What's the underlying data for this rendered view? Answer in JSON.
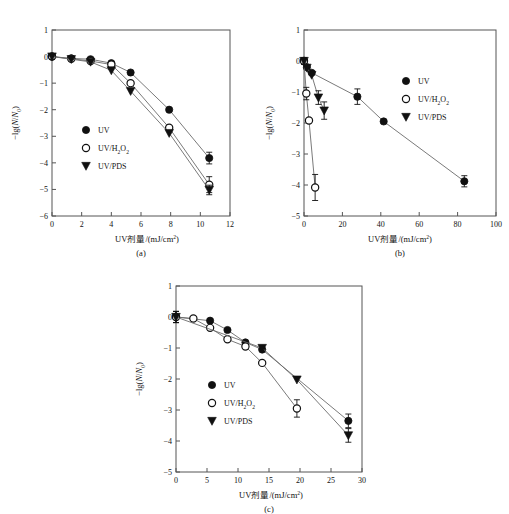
{
  "figure": {
    "background": "#ffffff",
    "axis_color": "#555555",
    "marker_fill_solid": "#101010",
    "marker_fill_open": "#ffffff",
    "line_color": "#6b6b6b"
  },
  "panels": [
    {
      "id": "a",
      "caption": "(a)",
      "xlabel": "UV剂量/(mJ/cm²)",
      "ylabel": "−lg(N/N₀)",
      "xlim": [
        0,
        12
      ],
      "ylim": [
        -6,
        1
      ],
      "xticks": [
        0,
        2,
        4,
        6,
        8,
        10,
        12
      ],
      "yticks": [
        1,
        0,
        -1,
        -2,
        -3,
        -4,
        -5,
        -6
      ],
      "legend": [
        "UV",
        "UV/H₂O₂",
        "UV/PDS"
      ]
    },
    {
      "id": "b",
      "caption": "(b)",
      "xlabel": "UV剂量/(mJ/cm²)",
      "ylabel": "−lg(N/N₀)",
      "xlim": [
        0,
        100
      ],
      "ylim": [
        -5,
        1
      ],
      "xticks": [
        0,
        20,
        40,
        60,
        80,
        100
      ],
      "yticks": [
        1,
        0,
        -1,
        -2,
        -3,
        -4,
        -5
      ],
      "legend": [
        "UV",
        "UV/H₂O₂",
        "UV/PDS"
      ]
    },
    {
      "id": "c",
      "caption": "(c)",
      "xlabel": "UV剂量/(mJ/cm²)",
      "ylabel": "−lg(N/N₀)",
      "xlim": [
        0,
        30
      ],
      "ylim": [
        -5,
        1
      ],
      "xticks": [
        0,
        5,
        10,
        15,
        20,
        25,
        30
      ],
      "yticks": [
        1,
        0,
        -1,
        -2,
        -3,
        -4,
        -5
      ],
      "legend": [
        "UV",
        "UV/H₂O₂",
        "UV/PDS"
      ]
    }
  ],
  "chart_data": [
    {
      "type": "scatter",
      "panel": "a",
      "title": "(a)",
      "xlabel": "UV剂量/(mJ/cm²)",
      "ylabel": "−lg(N/N₀)",
      "xlim": [
        0,
        12
      ],
      "ylim": [
        -6,
        1
      ],
      "xticks": [
        0,
        2,
        4,
        6,
        8,
        10,
        12
      ],
      "yticks": [
        1,
        0,
        -1,
        -2,
        -3,
        -4,
        -5,
        -6
      ],
      "grid": false,
      "legend_position": "lower-left-inside",
      "series": [
        {
          "name": "UV",
          "marker": "filled-circle",
          "x": [
            0,
            1.3,
            2.6,
            4.0,
            5.3,
            7.9,
            10.6
          ],
          "y": [
            0.0,
            -0.07,
            -0.1,
            -0.25,
            -0.6,
            -2.0,
            -3.82
          ],
          "yerr": [
            0.1,
            0.0,
            0.0,
            0.0,
            0.0,
            0.0,
            0.22
          ]
        },
        {
          "name": "UV/H₂O₂",
          "marker": "open-circle",
          "x": [
            0,
            1.3,
            2.6,
            4.0,
            5.3,
            7.9,
            10.6
          ],
          "y": [
            0.0,
            -0.08,
            -0.17,
            -0.3,
            -1.0,
            -2.68,
            -4.82
          ],
          "yerr": [
            0.1,
            0.0,
            0.0,
            0.0,
            0.0,
            0.0,
            0.3
          ]
        },
        {
          "name": "UV/PDS",
          "marker": "filled-triangle-down",
          "x": [
            0,
            1.3,
            2.6,
            4.0,
            5.3,
            7.9,
            10.6
          ],
          "y": [
            0.0,
            -0.1,
            -0.2,
            -0.52,
            -1.3,
            -2.88,
            -5.02
          ],
          "yerr": [
            0.1,
            0.0,
            0.0,
            0.0,
            0.0,
            0.0,
            0.18
          ]
        }
      ]
    },
    {
      "type": "scatter",
      "panel": "b",
      "title": "(b)",
      "xlabel": "UV剂量/(mJ/cm²)",
      "ylabel": "−lg(N/N₀)",
      "xlim": [
        0,
        100
      ],
      "ylim": [
        -5,
        1
      ],
      "xticks": [
        0,
        20,
        40,
        60,
        80,
        100
      ],
      "yticks": [
        1,
        0,
        -1,
        -2,
        -3,
        -4,
        -5
      ],
      "grid": false,
      "legend_position": "right-upper-inside",
      "series": [
        {
          "name": "UV",
          "marker": "filled-circle",
          "x": [
            0,
            1.5,
            4.0,
            27.8,
            41.5,
            83.5
          ],
          "y": [
            0.0,
            -0.2,
            -0.38,
            -1.15,
            -1.95,
            -3.88
          ],
          "yerr": [
            0.1,
            0.0,
            0.0,
            0.25,
            0.0,
            0.18
          ]
        },
        {
          "name": "UV/H₂O₂",
          "marker": "open-circle",
          "x": [
            0,
            1.2,
            2.6,
            5.8
          ],
          "y": [
            0.0,
            -1.05,
            -1.92,
            -4.08
          ],
          "yerr": [
            0.1,
            0.2,
            0.0,
            0.42
          ]
        },
        {
          "name": "UV/PDS",
          "marker": "filled-triangle-down",
          "x": [
            0,
            1.5,
            4.0,
            7.5,
            10.5
          ],
          "y": [
            0.0,
            -0.22,
            -0.45,
            -1.18,
            -1.6
          ],
          "yerr": [
            0.1,
            0.0,
            0.0,
            0.22,
            0.28
          ]
        }
      ]
    },
    {
      "type": "scatter",
      "panel": "c",
      "title": "(c)",
      "xlabel": "UV剂量/(mJ/cm²)",
      "ylabel": "−lg(N/N₀)",
      "xlim": [
        0,
        30
      ],
      "ylim": [
        -5,
        1
      ],
      "xticks": [
        0,
        5,
        10,
        15,
        20,
        25,
        30
      ],
      "yticks": [
        1,
        0,
        -1,
        -2,
        -3,
        -4,
        -5
      ],
      "grid": false,
      "legend_position": "lower-left-inside",
      "series": [
        {
          "name": "UV",
          "marker": "filled-circle",
          "x": [
            0,
            5.5,
            8.3,
            11.2,
            13.9,
            27.8
          ],
          "y": [
            0.0,
            -0.12,
            -0.42,
            -0.82,
            -1.05,
            -3.35
          ],
          "yerr": [
            0.18,
            0.0,
            0.0,
            0.0,
            0.0,
            0.22
          ]
        },
        {
          "name": "UV/H₂O₂",
          "marker": "open-circle",
          "x": [
            0,
            2.8,
            5.5,
            8.3,
            11.2,
            13.9,
            19.5
          ],
          "y": [
            0.0,
            -0.05,
            -0.35,
            -0.72,
            -0.95,
            -1.48,
            -2.95
          ],
          "yerr": [
            0.18,
            0.0,
            0.0,
            0.0,
            0.0,
            0.0,
            0.28
          ]
        },
        {
          "name": "UV/PDS",
          "marker": "filled-triangle-down",
          "x": [
            0,
            13.9,
            19.5,
            27.8
          ],
          "y": [
            0.0,
            -1.0,
            -2.02,
            -3.82
          ],
          "yerr": [
            0.18,
            0.0,
            0.0,
            0.22
          ]
        }
      ]
    }
  ]
}
